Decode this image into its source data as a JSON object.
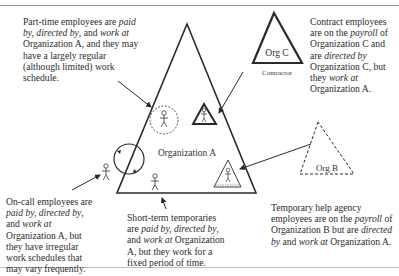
{
  "diagram": {
    "organizations": {
      "org_a": {
        "label": "Organization A"
      },
      "org_b": {
        "label": "Org B"
      },
      "org_c": {
        "label": "Org C",
        "sublabel": "Contractor"
      }
    },
    "descriptions": {
      "part_time": {
        "parts": [
          "Part-time employees are ",
          "paid by",
          ", ",
          "directed by",
          ", and ",
          "work at",
          " Organization A, and they may have a largely regular (although limited) work schedule."
        ]
      },
      "contract": {
        "parts": [
          "Contract employees are on the ",
          "payroll",
          " of Organization C and are ",
          "directed by",
          " Organization C, but they ",
          "work at",
          " Organization A."
        ]
      },
      "on_call": {
        "parts": [
          "On-call employees are ",
          "paid by",
          ", ",
          "directed by",
          ", and ",
          "work at",
          " Organization A, but they have irregular work schedules that may vary frequently."
        ]
      },
      "short_term": {
        "parts": [
          "Short-term temporaries are ",
          "paid by",
          ", ",
          "directed by",
          ", and ",
          "work at",
          " Organization A, but they work for a fixed period of time."
        ]
      },
      "temp_agency": {
        "parts": [
          "Temporary help agency employees are on the ",
          "payroll",
          " of Organization B but are ",
          "directed by",
          " and ",
          "work",
          " ",
          "at",
          " Organization A."
        ]
      }
    },
    "colors": {
      "line": "#2a2a2a",
      "text": "#2b2b2b",
      "rule": "#9a9a9a"
    }
  }
}
